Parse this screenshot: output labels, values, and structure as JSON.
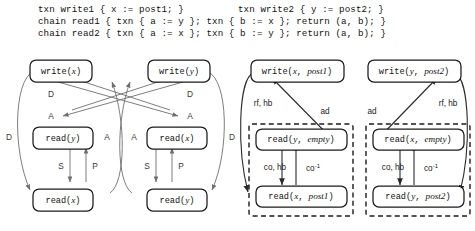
{
  "figure": {
    "code": {
      "line1_left": "txn write1 { x := post1; }",
      "line1_right": "txn write2 { y := post2; }",
      "line2": "chain read1 { txn { a := y }; txn { b := x }; return (a, b); }",
      "line3": "chain read2 { txn { a := x }; txn { b := y }; return (a, b); }"
    },
    "left_diagram": {
      "name": "dependency-graph-left",
      "nodes": [
        {
          "id": "w-x",
          "op": "write",
          "arg": "x",
          "label": "write(x)"
        },
        {
          "id": "w-y",
          "op": "write",
          "arg": "y",
          "label": "write(y)"
        },
        {
          "id": "r-y1",
          "op": "read",
          "arg": "y",
          "label": "read(y)"
        },
        {
          "id": "r-x1",
          "op": "read",
          "arg": "x",
          "label": "read(x)"
        },
        {
          "id": "r-x2",
          "op": "read",
          "arg": "x",
          "label": "read(x)"
        },
        {
          "id": "r-y2",
          "op": "read",
          "arg": "y",
          "label": "read(y)"
        }
      ],
      "edge_labels": {
        "d_left": "D",
        "a_left": "A",
        "d_right": "D",
        "a_right": "A",
        "d_outer_left": "D",
        "d_outer_right": "D",
        "a_inner_left": "A",
        "a_inner_right": "A",
        "s_left": "S",
        "p_left": "P",
        "s_right": "S",
        "p_right": "P"
      }
    },
    "right_diagram": {
      "name": "execution-graph-right",
      "nodes": [
        {
          "id": "w-x-post1",
          "op": "write",
          "arg": "x",
          "val": "post1",
          "label": "write(x, post1)"
        },
        {
          "id": "w-y-post2",
          "op": "write",
          "arg": "y",
          "val": "post2",
          "label": "write(y, post2)"
        },
        {
          "id": "r-y-empty",
          "op": "read",
          "arg": "y",
          "val": "empty",
          "label": "read(y, empty)"
        },
        {
          "id": "r-x-post1",
          "op": "read",
          "arg": "x",
          "val": "post1",
          "label": "read(x, post1)"
        },
        {
          "id": "r-x-empty",
          "op": "read",
          "arg": "x",
          "val": "empty",
          "label": "read(x, empty)"
        },
        {
          "id": "r-y-post2",
          "op": "read",
          "arg": "y",
          "val": "post2",
          "label": "read(y, post2)"
        }
      ],
      "edge_labels": {
        "rf_hb_left": "rf, hb",
        "rf_hb_right": "rf, hb",
        "ad_left": "ad",
        "ad_right": "ad",
        "co_hb_left": "co, hb",
        "co_hb_right": "co, hb",
        "co_inv_left": "co",
        "co_inv_right": "co",
        "co_inv_sup": "-1"
      },
      "groups": [
        {
          "id": "chain-read1-group",
          "label": ""
        },
        {
          "id": "chain-read2-group",
          "label": ""
        }
      ]
    },
    "colors": {
      "stroke": "#1b1b1b",
      "edge_gray": "#6e6e6e",
      "edge_dark": "#2a2a2a",
      "background": "#ffffff"
    }
  }
}
